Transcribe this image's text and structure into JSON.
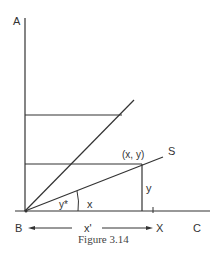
{
  "figure": {
    "caption": "Figure 3.14",
    "labels": {
      "A": "A",
      "B": "B",
      "C": "C",
      "X": "X",
      "S": "S",
      "point": "(x, y)",
      "y_side": "y",
      "x_adj": "x",
      "angle": "y*",
      "x_prime": "x'"
    },
    "colors": {
      "ink": "#333333",
      "background": "#ffffff"
    }
  }
}
